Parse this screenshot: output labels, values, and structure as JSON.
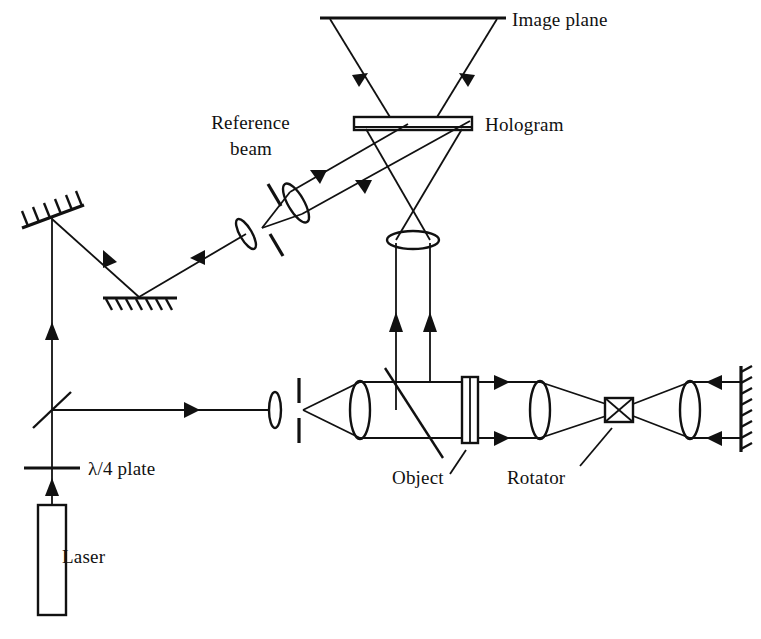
{
  "figure": {
    "background_color": "#ffffff",
    "line_color": "#111111",
    "width": 761,
    "height": 639
  },
  "labels": {
    "image_plane": "Image plane",
    "hologram": "Hologram",
    "reference_beam_line1": "Reference",
    "reference_beam_line2": "beam",
    "quarter_wave_plate": "λ/4 plate",
    "laser": "Laser",
    "object": "Object",
    "rotator": "Rotator"
  },
  "components": [
    {
      "name": "laser",
      "label": "Laser",
      "type": "source-box"
    },
    {
      "name": "quarter-wave-plate",
      "label": "λ/4 plate",
      "type": "waveplate"
    },
    {
      "name": "beam-splitter-lower-left",
      "label": "",
      "type": "beamsplitter-line"
    },
    {
      "name": "mirror-upper-left",
      "label": "",
      "type": "tilted-mirror-hatched"
    },
    {
      "name": "mirror-lower-left",
      "label": "",
      "type": "flat-mirror-hatched"
    },
    {
      "name": "reference-spatial-filter-lens",
      "label": "",
      "type": "lens"
    },
    {
      "name": "reference-pinhole",
      "label": "",
      "type": "pinhole-aperture"
    },
    {
      "name": "reference-collimating-lens",
      "label": "",
      "type": "lens"
    },
    {
      "name": "hologram-plate",
      "label": "Hologram",
      "type": "plate"
    },
    {
      "name": "image-plane-line",
      "label": "Image plane",
      "type": "plane-line"
    },
    {
      "name": "imaging-lens",
      "label": "",
      "type": "lens"
    },
    {
      "name": "object-spatial-filter-lens",
      "label": "",
      "type": "lens"
    },
    {
      "name": "object-pinhole",
      "label": "",
      "type": "pinhole-aperture"
    },
    {
      "name": "object-collimating-lens",
      "label": "",
      "type": "lens"
    },
    {
      "name": "beam-splitter-object-arm",
      "label": "",
      "type": "beamsplitter-line"
    },
    {
      "name": "object-plate",
      "label": "Object",
      "type": "sample-plate"
    },
    {
      "name": "relay-lens",
      "label": "",
      "type": "lens"
    },
    {
      "name": "rotator-box",
      "label": "Rotator",
      "type": "rotator"
    },
    {
      "name": "final-lens",
      "label": "",
      "type": "lens"
    },
    {
      "name": "mirror-right",
      "label": "",
      "type": "vertical-mirror-hatched"
    }
  ]
}
